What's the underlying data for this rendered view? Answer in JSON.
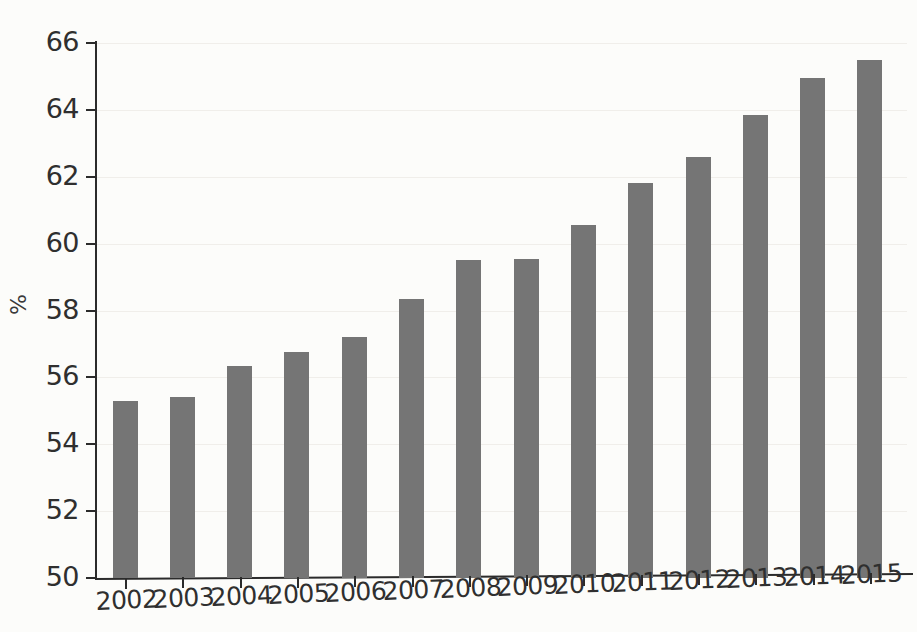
{
  "chart_data": {
    "type": "bar",
    "title": "",
    "subtitle": "",
    "xlabel": "",
    "ylabel": "%",
    "categories": [
      "2002",
      "2003",
      "2004",
      "2005",
      "2006",
      "2007",
      "2008",
      "2009",
      "2010",
      "2011",
      "2012",
      "2013",
      "2014",
      "2015"
    ],
    "values": [
      55.3,
      55.4,
      56.35,
      56.75,
      57.2,
      58.35,
      59.5,
      59.55,
      60.55,
      61.8,
      62.6,
      63.85,
      64.95,
      65.5
    ],
    "series": [
      {
        "name": "",
        "values": [
          55.3,
          55.4,
          56.35,
          56.75,
          57.2,
          58.35,
          59.5,
          59.55,
          60.55,
          61.8,
          62.6,
          63.85,
          64.95,
          65.5
        ]
      }
    ],
    "ylim": [
      50,
      66
    ],
    "yticks": [
      50,
      52,
      54,
      56,
      58,
      60,
      62,
      64,
      66
    ],
    "ytick_labels": [
      "50",
      "52",
      "54",
      "56",
      "58",
      "60",
      "62",
      "64",
      "66"
    ],
    "xtick_labels": [
      "2002",
      "2003",
      "2004",
      "2005",
      "2006",
      "2007",
      "2008",
      "2009",
      "2010",
      "2011",
      "2012",
      "2013",
      "2014",
      "2015"
    ],
    "grid": true,
    "legend": null,
    "legend_position": "none",
    "annotations": [],
    "colors": {
      "bar": "#757575",
      "axis": "#2b2b2b",
      "grid": "#f0eeea",
      "background": "#fcfcfa",
      "text": "#2f2f2f"
    }
  }
}
